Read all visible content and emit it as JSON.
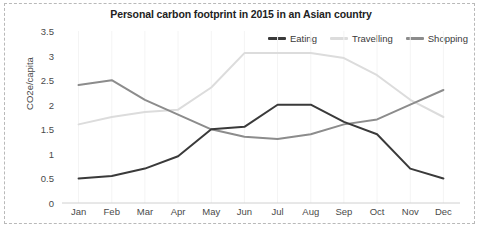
{
  "chart_data": {
    "type": "line",
    "title": "Personal carbon footprint in 2015 in an Asian country",
    "xlabel": "",
    "ylabel": "CO2e/capita",
    "categories": [
      "Jan",
      "Feb",
      "Mar",
      "Apr",
      "May",
      "Jun",
      "Jul",
      "Aug",
      "Sep",
      "Oct",
      "Nov",
      "Dec"
    ],
    "ylim": [
      0,
      3.5
    ],
    "yticks": [
      0,
      0.5,
      1,
      1.5,
      2,
      2.5,
      3,
      3.5
    ],
    "ytick_labels": [
      "0",
      "0.5",
      "1",
      "1.5",
      "2",
      "2.5",
      "3",
      "3.5"
    ],
    "grid": "vertical-only",
    "legend_position": "top-right",
    "series": [
      {
        "name": "Eating",
        "color": "#3a3a3a",
        "values": [
          0.5,
          0.55,
          0.7,
          0.95,
          1.5,
          1.55,
          2.0,
          2.0,
          1.65,
          1.4,
          0.7,
          0.5
        ]
      },
      {
        "name": "Travelling",
        "color": "#dcdcdc",
        "values": [
          1.6,
          1.75,
          1.85,
          1.9,
          2.35,
          3.05,
          3.05,
          3.05,
          2.95,
          2.6,
          2.1,
          1.75
        ]
      },
      {
        "name": "Shopping",
        "color": "#8c8c8c",
        "values": [
          2.4,
          2.5,
          2.1,
          1.8,
          1.5,
          1.35,
          1.3,
          1.4,
          1.6,
          1.7,
          2.0,
          2.3
        ]
      }
    ]
  }
}
